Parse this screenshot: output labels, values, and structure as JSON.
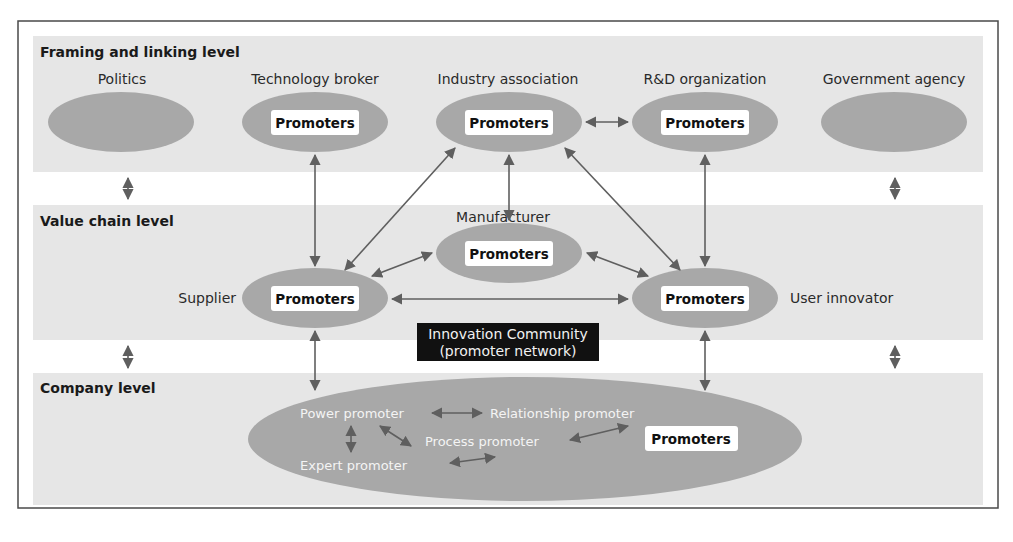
{
  "colors": {
    "band": "#e6e6e6",
    "ellipse": "#a8a8a8",
    "arrow": "#5f5f5f",
    "frame": "#4a4a4a",
    "promoter_box": "#ffffff",
    "community_box": "#111111"
  },
  "levels": {
    "framing": {
      "title": "Framing and linking level"
    },
    "value_chain": {
      "title": "Value chain level"
    },
    "company": {
      "title": "Company level"
    }
  },
  "framing_actors": [
    {
      "label": "Politics",
      "has_promoters": false
    },
    {
      "label": "Technology broker",
      "has_promoters": true
    },
    {
      "label": "Industry association",
      "has_promoters": true
    },
    {
      "label": "R&D organization",
      "has_promoters": true
    },
    {
      "label": "Government agency",
      "has_promoters": false
    }
  ],
  "value_chain_actors": [
    {
      "label": "Manufacturer",
      "has_promoters": true
    },
    {
      "label": "Supplier",
      "has_promoters": true
    },
    {
      "label": "User innovator",
      "has_promoters": true
    }
  ],
  "promoter_box_label": "Promoters",
  "community": {
    "line1": "Innovation Community",
    "line2": "(promoter network)"
  },
  "company_roles": {
    "power": "Power promoter",
    "relationship": "Relationship promoter",
    "process": "Process promoter",
    "expert": "Expert promoter",
    "promoters": "Promoters"
  }
}
